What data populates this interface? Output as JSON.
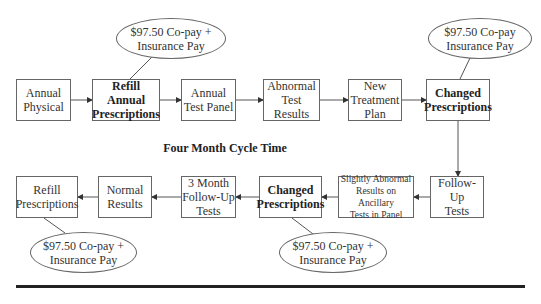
{
  "diagram": {
    "caption": "Four Month Cycle Time",
    "top_row": [
      {
        "id": "annual-physical",
        "label": "Annual\nPhysical",
        "bold": false
      },
      {
        "id": "refill-annual-prescriptions",
        "label": "Refill Annual\nPrescriptions",
        "bold": true
      },
      {
        "id": "annual-test-panel",
        "label": "Annual\nTest Panel",
        "bold": false
      },
      {
        "id": "abnormal-test-results",
        "label": "Abnormal\nTest Results",
        "bold": false
      },
      {
        "id": "new-treatment-plan",
        "label": "New\nTreatment\nPlan",
        "bold": false
      },
      {
        "id": "changed-prescriptions-top",
        "label": "Changed\nPrescriptions",
        "bold": true
      }
    ],
    "bottom_row": [
      {
        "id": "refill-prescriptions",
        "label": "Refill\nPrescriptions",
        "bold": false
      },
      {
        "id": "normal-results",
        "label": "Normal\nResults",
        "bold": false
      },
      {
        "id": "three-month-follow-up-tests",
        "label": "3 Month\nFollow-Up\nTests",
        "bold": false
      },
      {
        "id": "changed-prescriptions-bottom",
        "label": "Changed\nPrescriptions",
        "bold": true
      },
      {
        "id": "slightly-abnormal-results",
        "label": "Slightly Abnormal\nResults on Ancillary\nTests in Panel",
        "bold": false
      },
      {
        "id": "follow-up-tests",
        "label": "Follow-Up\nTests",
        "bold": false
      }
    ],
    "cost_notes": [
      {
        "id": "cost-refill-annual",
        "label": "$97.50 Co-pay +\nInsurance Pay",
        "attached_to": "refill-annual-prescriptions"
      },
      {
        "id": "cost-changed-top",
        "label": "$97.50 Co-pay\nInsurance Pay",
        "attached_to": "changed-prescriptions-top"
      },
      {
        "id": "cost-refill",
        "label": "$97.50 Co-pay +\nInsurance Pay",
        "attached_to": "refill-prescriptions"
      },
      {
        "id": "cost-changed-bottom",
        "label": "$97.50 Co-pay +\nInsurance Pay",
        "attached_to": "changed-prescriptions-bottom"
      }
    ],
    "flow": [
      [
        "annual-physical",
        "refill-annual-prescriptions"
      ],
      [
        "refill-annual-prescriptions",
        "annual-test-panel"
      ],
      [
        "annual-test-panel",
        "abnormal-test-results"
      ],
      [
        "abnormal-test-results",
        "new-treatment-plan"
      ],
      [
        "new-treatment-plan",
        "changed-prescriptions-top"
      ],
      [
        "changed-prescriptions-top",
        "follow-up-tests"
      ],
      [
        "follow-up-tests",
        "slightly-abnormal-results"
      ],
      [
        "slightly-abnormal-results",
        "changed-prescriptions-bottom"
      ],
      [
        "changed-prescriptions-bottom",
        "three-month-follow-up-tests"
      ],
      [
        "three-month-follow-up-tests",
        "normal-results"
      ],
      [
        "normal-results",
        "refill-prescriptions"
      ]
    ],
    "colors": {
      "line": "#555555",
      "text": "#333333",
      "rule": "#222222"
    }
  }
}
